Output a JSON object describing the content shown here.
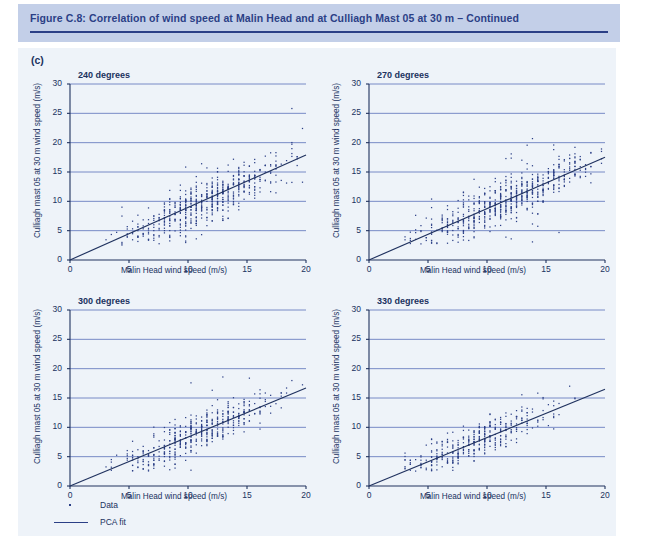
{
  "header": {
    "title": "Figure C.8: Correlation of wind speed at Malin Head and at Culliagh Mast 05 at 30 m – Continued"
  },
  "panel_letter": "(c)",
  "colors": {
    "header_band": "#c3cfe8",
    "body_background": "#eef3f9",
    "title_text": "#2b3f86",
    "axis": "#20325f",
    "gridline": "#6a7fc0",
    "data_point": "#2b3f86",
    "fit_line": "#20325f"
  },
  "legend": {
    "items": [
      {
        "key": "dot",
        "label": "Data"
      },
      {
        "key": "line",
        "label": "PCA fit"
      }
    ]
  },
  "chart_data": [
    {
      "type": "scatter",
      "title": "240 degrees",
      "xlabel": "Malin Head wind speed (m/s)",
      "ylabel": "Culliagh mast 05 at 30 m wind speed (m/s)",
      "xlim": [
        0,
        20
      ],
      "ylim": [
        0,
        30
      ],
      "xticks": [
        0,
        5,
        10,
        15,
        20
      ],
      "yticks": [
        0,
        5,
        10,
        15,
        20,
        25,
        30
      ],
      "grid": true,
      "legend_position": "below-figure",
      "fit": {
        "name": "PCA fit",
        "slope": 0.895,
        "intercept": 0.0,
        "x_from": 0,
        "x_to": 20
      },
      "point_count": 1180,
      "scatter_model": {
        "x_min": 3.0,
        "x_max": 19.6,
        "x_step": 0.45,
        "x_peak": 11.5,
        "x_spread": 3.5,
        "y_slope": 0.895,
        "y_intercept": 0.0,
        "y_noise": 1.9,
        "y_outlier_fraction": 0.1,
        "y_outlier_noise": 4.6,
        "seed": 2401
      }
    },
    {
      "type": "scatter",
      "title": "270 degrees",
      "xlabel": "Malin Head wind speed (m/s)",
      "ylabel": "Culliagh mast 05 at 30 m wind speed (m/s)",
      "xlim": [
        0,
        20
      ],
      "ylim": [
        0,
        30
      ],
      "xticks": [
        0,
        5,
        10,
        15,
        20
      ],
      "yticks": [
        0,
        5,
        10,
        15,
        20,
        25,
        30
      ],
      "grid": true,
      "legend_position": "below-figure",
      "fit": {
        "name": "PCA fit",
        "slope": 0.875,
        "intercept": 0.0,
        "x_from": 0,
        "x_to": 20
      },
      "point_count": 1240,
      "scatter_model": {
        "x_min": 3.0,
        "x_max": 19.8,
        "x_step": 0.45,
        "x_peak": 11.8,
        "x_spread": 3.6,
        "y_slope": 0.875,
        "y_intercept": 0.3,
        "y_noise": 1.8,
        "y_outlier_fraction": 0.09,
        "y_outlier_noise": 4.4,
        "seed": 2702
      }
    },
    {
      "type": "scatter",
      "title": "300 degrees",
      "xlabel": "Malin Head wind speed (m/s)",
      "ylabel": "Culliagh mast 05 at 30 m wind speed (m/s)",
      "xlim": [
        0,
        20
      ],
      "ylim": [
        0,
        30
      ],
      "xticks": [
        0,
        5,
        10,
        15,
        20
      ],
      "yticks": [
        0,
        5,
        10,
        15,
        20,
        25,
        30
      ],
      "grid": true,
      "legend_position": "below-figure",
      "fit": {
        "name": "PCA fit",
        "slope": 0.835,
        "intercept": 0.0,
        "x_from": 0,
        "x_to": 20
      },
      "point_count": 980,
      "scatter_model": {
        "x_min": 3.0,
        "x_max": 19.7,
        "x_step": 0.45,
        "x_peak": 10.8,
        "x_spread": 3.3,
        "y_slope": 0.835,
        "y_intercept": 0.2,
        "y_noise": 1.6,
        "y_outlier_fraction": 0.07,
        "y_outlier_noise": 3.8,
        "seed": 3003
      }
    },
    {
      "type": "scatter",
      "title": "330 degrees",
      "xlabel": "Malin Head wind speed (m/s)",
      "ylabel": "Culliagh mast 05 at 30 m wind speed (m/s)",
      "xlim": [
        0,
        20
      ],
      "ylim": [
        0,
        30
      ],
      "xticks": [
        0,
        5,
        10,
        15,
        20
      ],
      "yticks": [
        0,
        5,
        10,
        15,
        20,
        25,
        30
      ],
      "grid": true,
      "legend_position": "below-figure",
      "fit": {
        "name": "PCA fit",
        "slope": 0.825,
        "intercept": 0.0,
        "x_from": 0,
        "x_to": 20
      },
      "point_count": 820,
      "scatter_model": {
        "x_min": 3.0,
        "x_max": 19.3,
        "x_step": 0.45,
        "x_peak": 9.2,
        "x_spread": 3.0,
        "y_slope": 0.825,
        "y_intercept": 0.2,
        "y_noise": 1.5,
        "y_outlier_fraction": 0.07,
        "y_outlier_noise": 3.5,
        "seed": 3304
      }
    }
  ]
}
